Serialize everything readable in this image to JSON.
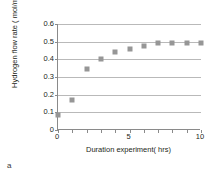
{
  "caption": "a",
  "chart_data": {
    "type": "scatter",
    "title": "",
    "xlabel": "Duration experiment( hrs)",
    "ylabel": "Hydrogen flow rate ( mol/m².s)",
    "xlim": [
      0,
      10
    ],
    "ylim": [
      0,
      0.6
    ],
    "grid": "horizontal",
    "legend": "none",
    "marker": "square",
    "marker_color": "#969696",
    "xticks": [
      0,
      5,
      10
    ],
    "xtick_labels": [
      "0",
      "5",
      "10"
    ],
    "xtick_minor": [
      0,
      1,
      2,
      3,
      4,
      5,
      6,
      7,
      8,
      9,
      10
    ],
    "yticks": [
      0,
      0.1,
      0.2,
      0.3,
      0.4,
      0.5,
      0.6
    ],
    "ytick_labels": [
      "0",
      "0.1",
      "0.2",
      "0.3",
      "0.4",
      "0.5",
      "0.6"
    ],
    "x": [
      0,
      1,
      2,
      3,
      4,
      5,
      6,
      7,
      8,
      9,
      10
    ],
    "values": [
      0.085,
      0.167,
      0.347,
      0.403,
      0.444,
      0.456,
      0.477,
      0.494,
      0.494,
      0.495,
      0.493
    ],
    "points": [
      {
        "x": 0,
        "y": 0.085
      },
      {
        "x": 1,
        "y": 0.167
      },
      {
        "x": 2,
        "y": 0.347
      },
      {
        "x": 3,
        "y": 0.403
      },
      {
        "x": 4,
        "y": 0.444
      },
      {
        "x": 5,
        "y": 0.456
      },
      {
        "x": 6,
        "y": 0.477
      },
      {
        "x": 7,
        "y": 0.494
      },
      {
        "x": 8,
        "y": 0.494
      },
      {
        "x": 9,
        "y": 0.495
      },
      {
        "x": 10,
        "y": 0.493
      }
    ]
  }
}
